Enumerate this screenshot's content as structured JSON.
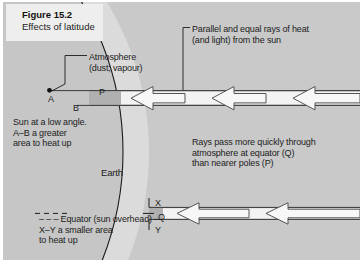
{
  "figure": {
    "number": "Figure 15.2",
    "caption": "Effects of latitude"
  },
  "labels": {
    "atmosphere": "Atmosphere\n(dust; vapour)",
    "rays_source": "Parallel and equal rays of heat\n(and light) from the sun",
    "sun_low_angle": "Sun at a low angle.\nA–B a greater\narea to heat up",
    "rays_description": "Rays pass more quickly through\natmosphere at equator (Q)\nthan nearer poles (P)",
    "equator": "– – – Equator (sun overhead) –\nX–Y a smaller area\nto heat up",
    "earth": "Earth"
  },
  "points": {
    "a": "A",
    "b": "B",
    "p": "P",
    "x": "X",
    "q": "Q",
    "y": "Y"
  },
  "colors": {
    "plate_background": "#c9c9c9",
    "title_box": "#eeeeee",
    "earth_fill": "#cccccc",
    "atmosphere_fill": "#dcdcdc",
    "beam_fill": "#f2f2f2",
    "band_shadow": "#b2b2b2",
    "line": "#1c1c1c",
    "arrow_outline": "#4a4a4a",
    "text": "#1c1c1c"
  },
  "beams": {
    "polar": {
      "label": "P",
      "arrow_count": 3,
      "top_y": 88,
      "bottom_y": 103
    },
    "equatorial": {
      "label": "Q",
      "arrow_count": 2,
      "top_y": 205,
      "bottom_y": 217
    },
    "direction": "leftward"
  }
}
